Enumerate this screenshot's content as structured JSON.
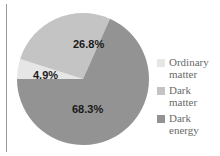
{
  "chart_data": {
    "type": "pie",
    "title": "",
    "categories": [
      "Ordinary matter",
      "Dark matter",
      "Dark energy"
    ],
    "values": [
      4.9,
      26.8,
      68.3
    ],
    "labels": [
      "4.9%",
      "26.8%",
      "68.3%"
    ],
    "colors": [
      "#e6e6e6",
      "#c4c4c4",
      "#939393"
    ],
    "legend_position": "right"
  },
  "legend": {
    "items": [
      {
        "line1": "Ordinary",
        "line2": "matter",
        "color": "#e6e6e6"
      },
      {
        "line1": "Dark",
        "line2": "matter",
        "color": "#c4c4c4"
      },
      {
        "line1": "Dark",
        "line2": "energy",
        "color": "#939393"
      }
    ]
  },
  "slice_labels": {
    "ordinary": "4.9%",
    "dark_matter": "26.8%",
    "dark_energy": "68.3%"
  }
}
